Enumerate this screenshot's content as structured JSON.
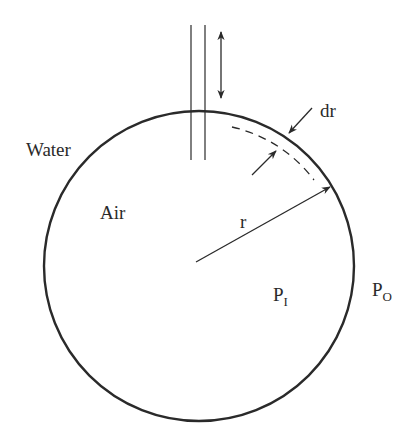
{
  "diagram": {
    "labels": {
      "water": "Water",
      "air": "Air",
      "radius": "r",
      "shell_thickness": "dr",
      "inner_pressure": {
        "base": "P",
        "sub": "I"
      },
      "outer_pressure": {
        "base": "P",
        "sub": "O"
      }
    },
    "colors": {
      "stroke": "#2a2a2a",
      "background": "#ffffff"
    },
    "bubble": {
      "cx": 199,
      "cy": 266,
      "r": 155
    },
    "tube": {
      "x_left": 191,
      "x_right": 205,
      "y_top": 25,
      "y_bottom": 160
    },
    "double_arrow": {
      "x": 221,
      "y_top": 30,
      "y_bottom": 100
    },
    "radius_arrow": {
      "from": [
        196,
        262
      ],
      "to": [
        330,
        187
      ]
    }
  }
}
